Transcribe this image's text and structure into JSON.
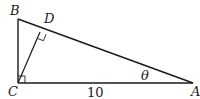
{
  "figure": {
    "type": "right-triangle-with-altitude",
    "vertices": {
      "A": {
        "label": "A"
      },
      "B": {
        "label": "B"
      },
      "C": {
        "label": "C"
      },
      "D": {
        "label": "D"
      }
    },
    "side_labels": {
      "CA": "10"
    },
    "angle_labels": {
      "A": "θ"
    },
    "right_angles": [
      "C",
      "D"
    ],
    "colors": {
      "stroke": "#1a1a1a",
      "background": "#ffffff"
    }
  }
}
